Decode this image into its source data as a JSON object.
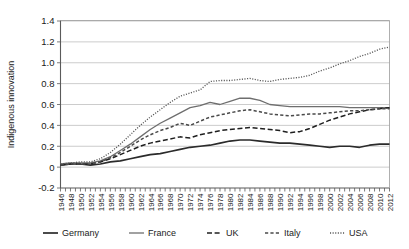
{
  "chart_data": {
    "type": "line",
    "title": "",
    "xlabel": "",
    "ylabel": "Indigenous innovation",
    "ylim": [
      -0.2,
      1.4
    ],
    "yticks": [
      -0.2,
      0,
      0.2,
      0.4,
      0.6,
      0.8,
      1.0,
      1.2,
      1.4
    ],
    "ytick_labels": [
      "-0.2",
      "0",
      "0.2",
      "0.4",
      "0.6",
      "0.8",
      "1.0",
      "1.2",
      "1.4"
    ],
    "grid": true,
    "legend_position": "bottom",
    "xlim": [
      1946,
      2012
    ],
    "x": [
      1946,
      1948,
      1950,
      1952,
      1954,
      1956,
      1958,
      1960,
      1962,
      1964,
      1966,
      1968,
      1970,
      1972,
      1974,
      1976,
      1978,
      1980,
      1982,
      1984,
      1986,
      1988,
      1990,
      1992,
      1994,
      1996,
      1998,
      2000,
      2002,
      2004,
      2006,
      2008,
      2010,
      2012
    ],
    "xtick_labels": [
      "1946",
      "1948",
      "1950",
      "1952",
      "1954",
      "1956",
      "1958",
      "1960",
      "1962",
      "1964",
      "1966",
      "1968",
      "1970",
      "1972",
      "1974",
      "1976",
      "1978",
      "1980",
      "1982",
      "1984",
      "1986",
      "1988",
      "1990",
      "1992",
      "1994",
      "1996",
      "1998",
      "2000",
      "2002",
      "2004",
      "2006",
      "2008",
      "2010",
      "2012"
    ],
    "series": [
      {
        "name": "Germany",
        "style": "solid-thick",
        "color": "#2b2b2b",
        "values": [
          0.02,
          0.03,
          0.03,
          0.02,
          0.03,
          0.05,
          0.06,
          0.08,
          0.1,
          0.12,
          0.13,
          0.15,
          0.17,
          0.19,
          0.2,
          0.21,
          0.23,
          0.25,
          0.26,
          0.26,
          0.25,
          0.24,
          0.23,
          0.23,
          0.22,
          0.21,
          0.2,
          0.19,
          0.2,
          0.2,
          0.19,
          0.21,
          0.22,
          0.22
        ]
      },
      {
        "name": "France",
        "style": "solid-thin",
        "color": "#6e6e6e",
        "values": [
          0.03,
          0.04,
          0.04,
          0.04,
          0.06,
          0.1,
          0.16,
          0.22,
          0.29,
          0.36,
          0.42,
          0.47,
          0.52,
          0.57,
          0.59,
          0.62,
          0.6,
          0.63,
          0.66,
          0.66,
          0.64,
          0.6,
          0.59,
          0.58,
          0.58,
          0.58,
          0.58,
          0.58,
          0.58,
          0.57,
          0.57,
          0.57,
          0.57,
          0.57
        ]
      },
      {
        "name": "UK",
        "style": "dash-long",
        "color": "#1f1f1f",
        "values": [
          0.02,
          0.03,
          0.03,
          0.03,
          0.05,
          0.08,
          0.12,
          0.16,
          0.2,
          0.23,
          0.25,
          0.27,
          0.29,
          0.28,
          0.31,
          0.33,
          0.35,
          0.36,
          0.37,
          0.38,
          0.37,
          0.36,
          0.35,
          0.33,
          0.34,
          0.37,
          0.41,
          0.45,
          0.48,
          0.51,
          0.53,
          0.55,
          0.56,
          0.57
        ]
      },
      {
        "name": "Italy",
        "style": "dash-short",
        "color": "#4a4a4a",
        "values": [
          0.02,
          0.03,
          0.03,
          0.03,
          0.05,
          0.09,
          0.14,
          0.2,
          0.26,
          0.31,
          0.35,
          0.38,
          0.42,
          0.4,
          0.44,
          0.48,
          0.5,
          0.52,
          0.54,
          0.55,
          0.53,
          0.51,
          0.5,
          0.49,
          0.5,
          0.51,
          0.51,
          0.52,
          0.53,
          0.54,
          0.54,
          0.55,
          0.56,
          0.56
        ]
      },
      {
        "name": "USA",
        "style": "dotted",
        "color": "#555555",
        "values": [
          0.03,
          0.04,
          0.05,
          0.05,
          0.08,
          0.14,
          0.22,
          0.31,
          0.4,
          0.48,
          0.55,
          0.62,
          0.68,
          0.71,
          0.74,
          0.82,
          0.83,
          0.83,
          0.84,
          0.85,
          0.83,
          0.82,
          0.84,
          0.85,
          0.86,
          0.88,
          0.92,
          0.95,
          0.99,
          1.02,
          1.06,
          1.09,
          1.13,
          1.15
        ]
      }
    ],
    "legend": [
      {
        "label": "Germany",
        "style": "solid-thick",
        "color": "#2b2b2b"
      },
      {
        "label": "France",
        "style": "solid-thin",
        "color": "#6e6e6e"
      },
      {
        "label": "UK",
        "style": "dash-long",
        "color": "#1f1f1f"
      },
      {
        "label": "Italy",
        "style": "dash-short",
        "color": "#4a4a4a"
      },
      {
        "label": "USA",
        "style": "dotted",
        "color": "#555555"
      }
    ]
  }
}
